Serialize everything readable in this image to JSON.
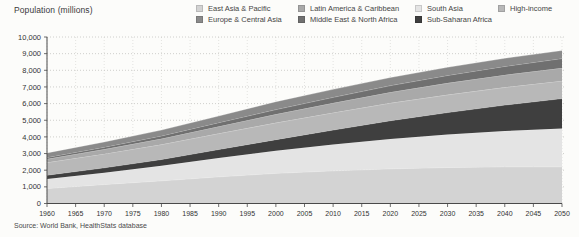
{
  "figure": {
    "y_axis_title": "Population (millions)",
    "source_note": "Source: World Bank, HealthStats database"
  },
  "legend": {
    "columns": [
      [
        {
          "label": "East Asia & Pacific",
          "color": "#d3d3d3"
        },
        {
          "label": "Europe & Central Asia",
          "color": "#8a8a8a"
        }
      ],
      [
        {
          "label": "Latin America & Caribbean",
          "color": "#a9a9a9"
        },
        {
          "label": "Middle East & North Africa",
          "color": "#707070"
        }
      ],
      [
        {
          "label": "South Asia",
          "color": "#e4e4e4"
        },
        {
          "label": "Sub-Saharan Africa",
          "color": "#3f3f3f"
        }
      ],
      [
        {
          "label": "High-income",
          "color": "#b8b8b8"
        }
      ]
    ]
  },
  "chart_data": {
    "type": "area",
    "stacked": true,
    "title": "",
    "ylabel": "Population (millions)",
    "xlabel": "",
    "source": "Source: World Bank, HealthStats database",
    "xlim": [
      1960,
      2050
    ],
    "ylim": [
      0,
      10000
    ],
    "grid": "dotted horizontal and vertical gridlines",
    "legend_position": "top",
    "x": [
      1960,
      1970,
      1980,
      1990,
      2000,
      2010,
      2020,
      2030,
      2040,
      2050
    ],
    "series_order": "bottom to top",
    "series": [
      {
        "name": "East Asia & Pacific",
        "color": "#d3d3d3",
        "values": [
          900,
          1140,
          1360,
          1600,
          1810,
          1960,
          2080,
          2160,
          2200,
          2200
        ]
      },
      {
        "name": "South Asia",
        "color": "#e4e4e4",
        "values": [
          570,
          710,
          900,
          1130,
          1360,
          1590,
          1800,
          1980,
          2150,
          2300
        ]
      },
      {
        "name": "Sub-Saharan Africa",
        "color": "#3f3f3f",
        "values": [
          225,
          290,
          380,
          510,
          665,
          860,
          1090,
          1320,
          1560,
          1800
        ]
      },
      {
        "name": "High-income",
        "color": "#b8b8b8",
        "values": [
          765,
          840,
          900,
          960,
          1010,
          1040,
          1060,
          1065,
          1065,
          1060
        ]
      },
      {
        "name": "Latin America & Caribbean",
        "color": "#a9a9a9",
        "values": [
          210,
          275,
          350,
          430,
          515,
          585,
          650,
          705,
          745,
          775
        ]
      },
      {
        "name": "Middle East & North Africa",
        "color": "#707070",
        "values": [
          95,
          125,
          170,
          225,
          280,
          340,
          400,
          460,
          515,
          570
        ]
      },
      {
        "name": "Europe & Central Asia",
        "color": "#8a8a8a",
        "values": [
          275,
          315,
          350,
          400,
          475,
          480,
          485,
          490,
          488,
          485
        ]
      }
    ],
    "xticks": [
      1960,
      1965,
      1970,
      1975,
      1980,
      1985,
      1990,
      1995,
      2000,
      2005,
      2010,
      2015,
      2020,
      2025,
      2030,
      2035,
      2040,
      2045,
      2050
    ],
    "yticks": [
      {
        "value": 0,
        "label": "0"
      },
      {
        "value": 1000,
        "label": "1,000"
      },
      {
        "value": 2000,
        "label": "2,000"
      },
      {
        "value": 3000,
        "label": "3,000"
      },
      {
        "value": 4000,
        "label": "4,000"
      },
      {
        "value": 5000,
        "label": "5,000"
      },
      {
        "value": 6000,
        "label": "6,000"
      },
      {
        "value": 7000,
        "label": "7,000"
      },
      {
        "value": 8000,
        "label": "8,000"
      },
      {
        "value": 9000,
        "label": "9,000"
      },
      {
        "value": 10000,
        "label": "10,000"
      }
    ]
  }
}
